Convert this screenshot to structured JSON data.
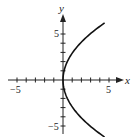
{
  "chart_data": {
    "type": "line",
    "title": "",
    "xlabel": "x",
    "ylabel": "y",
    "xlim": [
      -6,
      6
    ],
    "ylim": [
      -6.5,
      7
    ],
    "grid": false,
    "x_tick_labels": [
      "-5",
      "5"
    ],
    "y_tick_labels": [
      "5",
      "-5"
    ],
    "x_ticks": [
      -5,
      -4,
      -3,
      -2,
      -1,
      1,
      2,
      3,
      4,
      5
    ],
    "y_ticks": [
      -5,
      -4,
      -3,
      -2,
      -1,
      1,
      2,
      3,
      4,
      5
    ],
    "series": [
      {
        "name": "x = y^2 / 8.5",
        "equation": "x = y^2 / 8.5",
        "points": [
          {
            "x": 4.5,
            "y": -6.2
          },
          {
            "x": 2.94,
            "y": -5
          },
          {
            "x": 1.06,
            "y": -3
          },
          {
            "x": 0.12,
            "y": -1
          },
          {
            "x": 0,
            "y": 0
          },
          {
            "x": 0.12,
            "y": 1
          },
          {
            "x": 1.06,
            "y": 3
          },
          {
            "x": 2.94,
            "y": 5
          },
          {
            "x": 4.5,
            "y": 6.2
          }
        ]
      }
    ]
  },
  "labels": {
    "x_axis": "x",
    "y_axis": "y",
    "x_neg": "−5",
    "x_pos": "5",
    "y_pos": "5",
    "y_neg": "−5"
  }
}
